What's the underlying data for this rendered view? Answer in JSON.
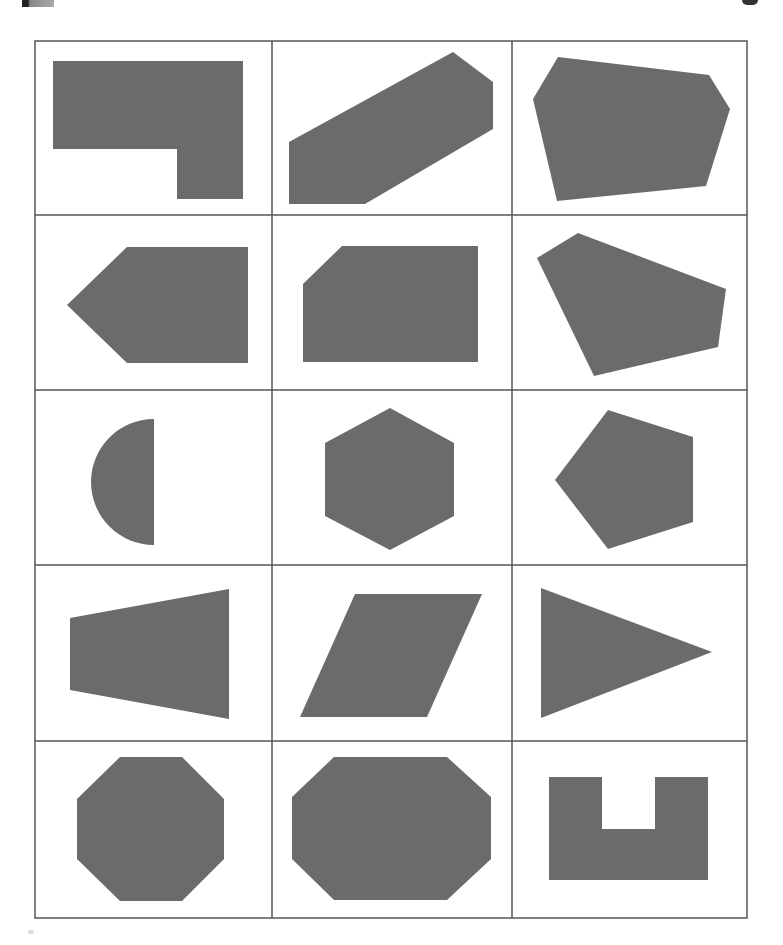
{
  "worksheet": {
    "grid": {
      "rows": 5,
      "columns": 3,
      "line_color": "#555555",
      "shape_fill": "#6b6b6b",
      "background": "#ffffff"
    },
    "cells": [
      {
        "row": 1,
        "col": 1,
        "shape": "L-shaped hexagon",
        "points": "53,61 243,61 243,199 177,199 177,149 53,149"
      },
      {
        "row": 1,
        "col": 2,
        "shape": "irregular hexagon",
        "points": "289,142 453,52 493,82 493,129 365,204 289,204"
      },
      {
        "row": 1,
        "col": 3,
        "shape": "irregular hexagon",
        "points": "558,57 709,75 730,109 706,186 557,201 533,99"
      },
      {
        "row": 2,
        "col": 1,
        "shape": "pentagon arrow",
        "points": "127,247 248,247 248,363 127,363 67,305"
      },
      {
        "row": 2,
        "col": 2,
        "shape": "pentagon (cut corner)",
        "points": "342,246 478,246 478,362 303,362 303,284"
      },
      {
        "row": 2,
        "col": 3,
        "shape": "irregular pentagon",
        "points": "578,233 726,289 718,347 594,376 537,258"
      },
      {
        "row": 3,
        "col": 1,
        "shape": "semicircle",
        "path": "M154,419 A63,63 0 0 0 154,545 Z"
      },
      {
        "row": 3,
        "col": 2,
        "shape": "regular hexagon",
        "points": "390,408 454,443 454,516 390,550 325,516 325,443"
      },
      {
        "row": 3,
        "col": 3,
        "shape": "regular pentagon",
        "points": "608,410 693,437 693,522 608,549 555,480"
      },
      {
        "row": 4,
        "col": 1,
        "shape": "trapezoid",
        "points": "70,618 229,589 229,719 70,690"
      },
      {
        "row": 4,
        "col": 2,
        "shape": "parallelogram",
        "points": "355,594 482,594 427,717 300,717"
      },
      {
        "row": 4,
        "col": 3,
        "shape": "triangle",
        "points": "541,588 712,652 541,718"
      },
      {
        "row": 5,
        "col": 1,
        "shape": "regular octagon",
        "points": "120,757 182,757 224,799 224,859 182,901 120,901 77,859 77,799"
      },
      {
        "row": 5,
        "col": 2,
        "shape": "elongated octagon",
        "points": "334,757 447,757 491,797 491,859 447,900 334,900 292,859 292,797"
      },
      {
        "row": 5,
        "col": 3,
        "shape": "U-shape",
        "points": "549,777 602,777 602,829 655,829 655,777 708,777 708,880 549,880"
      }
    ]
  }
}
